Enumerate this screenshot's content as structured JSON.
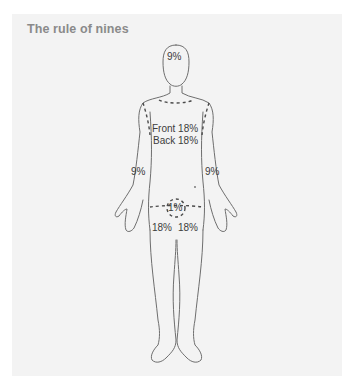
{
  "title": "The rule of nines",
  "colors": {
    "background": "#ffffff",
    "panel": "#f3f3f3",
    "title": "#8a8a8a",
    "outline": "#6e6e6e",
    "label": "#3c3c3c"
  },
  "regions": {
    "head": {
      "label": "9%"
    },
    "torso_front": {
      "label": "Front 18%"
    },
    "torso_back": {
      "label": "Back 18%"
    },
    "arm_right": {
      "label": "9%"
    },
    "arm_left": {
      "label": "9%"
    },
    "genitals": {
      "label": "1%"
    },
    "leg_right": {
      "label": "18%"
    },
    "leg_left": {
      "label": "18%"
    }
  }
}
